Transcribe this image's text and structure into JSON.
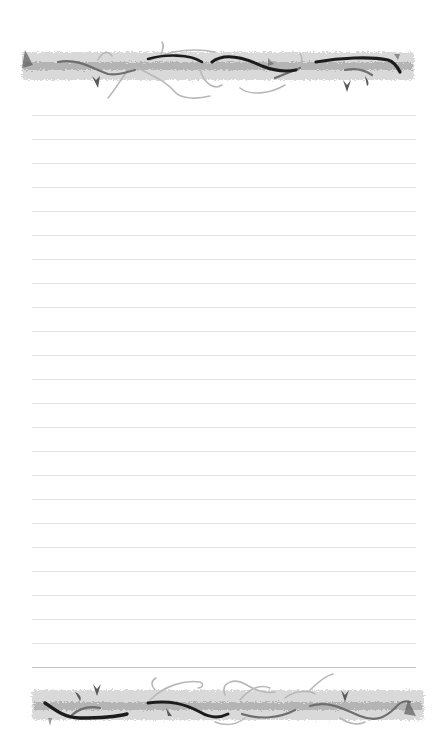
{
  "page": {
    "type": "decorative lined stationery",
    "background_color": "#ffffff"
  },
  "decorations": {
    "top_border": {
      "motif": "vine-border",
      "colors": {
        "band": "#c9c9c9",
        "band_dark": "#a9a9a9",
        "vine_dark": "#1e1e1e",
        "vine_mid": "#6b6b6b",
        "tendril": "#b5b5b5"
      }
    },
    "bottom_border": {
      "motif": "vine-border",
      "colors": {
        "band": "#c9c9c9",
        "band_dark": "#a9a9a9",
        "vine_dark": "#1e1e1e",
        "vine_mid": "#6b6b6b",
        "tendril": "#b5b5b5"
      }
    }
  },
  "ruled_lines": {
    "count": 24,
    "first_y": 115,
    "spacing": 24,
    "x_start": 32,
    "x_end": 416,
    "color": "#e2e2e2",
    "last_line_color": "#c4c4c4"
  }
}
